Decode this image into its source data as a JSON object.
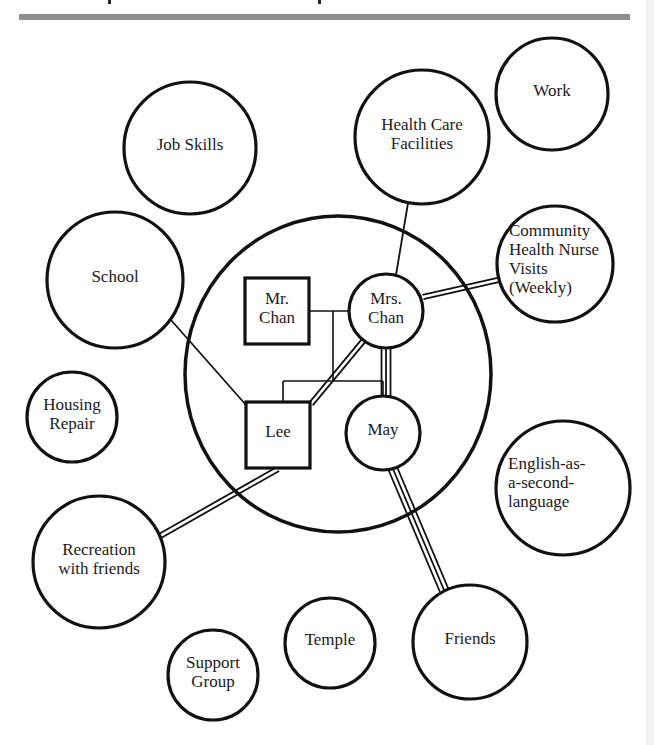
{
  "figure": {
    "type": "ecomap",
    "header_bar_color": "#8f8f8f",
    "stroke_color": "#111111",
    "background": "#ffffff"
  },
  "family_boundary": {
    "cx": 338,
    "cy": 374,
    "rx": 153,
    "ry": 158
  },
  "family_members": [
    {
      "id": "mr_chan",
      "shape": "square",
      "label_lines": [
        "Mr.",
        "Chan"
      ],
      "x": 245,
      "y": 278,
      "w": 64,
      "h": 66
    },
    {
      "id": "mrs_chan",
      "shape": "circle",
      "label_lines": [
        "Mrs.",
        "Chan"
      ],
      "cx": 386,
      "cy": 311,
      "r": 37
    },
    {
      "id": "lee",
      "shape": "square",
      "label_lines": [
        "Lee"
      ],
      "x": 246,
      "y": 402,
      "w": 64,
      "h": 66
    },
    {
      "id": "may",
      "shape": "circle",
      "label_lines": [
        "May"
      ],
      "cx": 383,
      "cy": 433,
      "r": 37
    }
  ],
  "external_systems": [
    {
      "id": "work",
      "label_lines": [
        "Work"
      ],
      "cx": 552,
      "cy": 94,
      "r": 56
    },
    {
      "id": "health_care",
      "label_lines": [
        "Health Care",
        "Facilities"
      ],
      "cx": 422,
      "cy": 137,
      "r": 67
    },
    {
      "id": "job_skills",
      "label_lines": [
        "Job Skills"
      ],
      "cx": 190,
      "cy": 148,
      "r": 66
    },
    {
      "id": "school",
      "label_lines": [
        "School"
      ],
      "cx": 115,
      "cy": 280,
      "r": 68
    },
    {
      "id": "chn_visits",
      "label_lines": [
        "Community",
        "Health Nurse",
        "Visits",
        "(Weekly)"
      ],
      "cx": 555,
      "cy": 264,
      "r": 58
    },
    {
      "id": "housing_repair",
      "label_lines": [
        "Housing",
        "Repair"
      ],
      "cx": 72,
      "cy": 417,
      "r": 45
    },
    {
      "id": "esl",
      "label_lines": [
        "English-as-",
        "a-second-",
        "language"
      ],
      "cx": 563,
      "cy": 488,
      "r": 67
    },
    {
      "id": "recreation",
      "label_lines": [
        "Recreation",
        "with friends"
      ],
      "cx": 99,
      "cy": 562,
      "r": 66
    },
    {
      "id": "friends",
      "label_lines": [
        "Friends"
      ],
      "cx": 470,
      "cy": 642,
      "r": 57
    },
    {
      "id": "temple",
      "label_lines": [
        "Temple"
      ],
      "cx": 330,
      "cy": 643,
      "r": 45
    },
    {
      "id": "support_group",
      "label_lines": [
        "Support",
        "Group"
      ],
      "cx": 213,
      "cy": 675,
      "r": 45
    }
  ],
  "connections": [
    {
      "from": "health_care",
      "to": "mrs_chan",
      "strength": "normal",
      "x1": 408,
      "y1": 203,
      "x2": 396,
      "y2": 275
    },
    {
      "from": "chn_visits",
      "to": "mrs_chan",
      "strength": "strong",
      "x1": 498,
      "y1": 280,
      "x2": 423,
      "y2": 297
    },
    {
      "from": "school",
      "to": "lee",
      "strength": "normal",
      "x1": 171,
      "y1": 320,
      "x2": 246,
      "y2": 405
    },
    {
      "from": "mrs_chan",
      "to": "lee",
      "strength": "strong",
      "x1": 364,
      "y1": 340,
      "x2": 311,
      "y2": 404
    },
    {
      "from": "mrs_chan",
      "to": "may",
      "strength": "very_strong",
      "x1": 386,
      "y1": 348,
      "x2": 386,
      "y2": 396
    },
    {
      "from": "lee",
      "to": "recreation",
      "strength": "strong",
      "x1": 278,
      "y1": 469,
      "x2": 160,
      "y2": 536
    },
    {
      "from": "may",
      "to": "friends",
      "strength": "very_strong",
      "x1": 393,
      "y1": 469,
      "x2": 444,
      "y2": 590
    }
  ],
  "kinship_lines": {
    "marriage": {
      "x1": 309,
      "y1": 311,
      "x2": 349,
      "y2": 311
    },
    "descent_drop": {
      "x1": 333,
      "y1": 311,
      "x2": 333,
      "y2": 381
    },
    "sibling_bar": {
      "x1": 283,
      "y1": 381,
      "x2": 383,
      "y2": 381
    },
    "to_lee": {
      "x1": 283,
      "y1": 381,
      "x2": 283,
      "y2": 402
    },
    "to_may": {
      "x1": 383,
      "y1": 381,
      "x2": 383,
      "y2": 396
    }
  },
  "legend_strength": {
    "normal": "single line",
    "strong": "double line",
    "very_strong": "triple line"
  }
}
